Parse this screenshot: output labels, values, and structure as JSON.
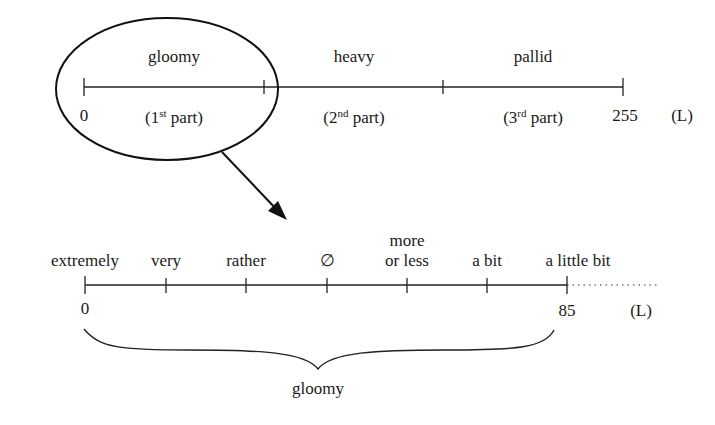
{
  "top_scale": {
    "segments": [
      {
        "word": "gloomy",
        "part_num": "1",
        "part_sup": "st",
        "part_word": "part)"
      },
      {
        "word": "heavy",
        "part_num": "2",
        "part_sup": "nd",
        "part_word": "part)"
      },
      {
        "word": "pallid",
        "part_num": "3",
        "part_sup": "rd",
        "part_word": "part)"
      }
    ],
    "start_value": "0",
    "end_value": "255",
    "unit": "(L)",
    "tick_x": [
      84,
      264,
      443,
      623
    ]
  },
  "zoom": {
    "highlighted_segment": "gloomy",
    "arrow": "zoom-arrow"
  },
  "bottom_scale": {
    "hedges": [
      "extremely",
      "very",
      "rather",
      "∅",
      "more",
      "or less",
      "a bit",
      "a little bit"
    ],
    "hedge_list": [
      {
        "label": "extremely"
      },
      {
        "label": "very"
      },
      {
        "label": "rather"
      },
      {
        "label": "∅"
      },
      {
        "label_line1": "more",
        "label_line2": "or less"
      },
      {
        "label": "a bit"
      },
      {
        "label": "a little bit"
      }
    ],
    "start_value": "0",
    "end_value": "85",
    "unit": "(L)",
    "tick_x": [
      85,
      166,
      246,
      327,
      407,
      487,
      567
    ],
    "brace_label": "gloomy"
  }
}
